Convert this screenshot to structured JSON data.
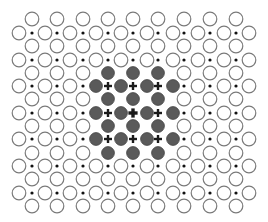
{
  "diagram": {
    "type": "crystal-lattice",
    "width": 268,
    "height": 222,
    "colors": {
      "background": "#ffffff",
      "open_circle_stroke": "#7a7a7a",
      "filled_circle": "#5a5a5a",
      "filled_circle_edge": "#444444",
      "dot": "#111111",
      "plus": "#1a1a1a"
    },
    "sizes": {
      "open_circle_radius": 6.8,
      "open_circle_stroke_width": 1.2,
      "filled_circle_radius": 6.4,
      "dot_radius": 1.6,
      "plus_arm": 4,
      "plus_stroke": 2.4,
      "plus_center_arm": 4.6,
      "plus_center_stroke": 3.4
    },
    "grid": {
      "offset_rows_y": [
        19,
        46,
        73,
        99,
        126,
        153,
        179,
        206
      ],
      "offset_rows_x": [
        32,
        57,
        83,
        108,
        133,
        158,
        184,
        210,
        236
      ],
      "main_rows_y": [
        33,
        60,
        86,
        113,
        139,
        166,
        193
      ],
      "main_rows_circle_x": [
        19,
        45,
        70,
        96,
        121,
        147,
        173,
        198,
        224,
        249
      ],
      "main_rows_dot_x": [
        32,
        57,
        83,
        108,
        133,
        158,
        184,
        210,
        236
      ]
    },
    "legend_of_symbols": [
      {
        "symbol": "open-circle",
        "meaning": "host lattice site"
      },
      {
        "symbol": "small-dot",
        "meaning": "interstitial site"
      },
      {
        "symbol": "filled-circle",
        "meaning": "substituted site in cluster"
      },
      {
        "symbol": "plus",
        "meaning": "interstitial within cluster"
      }
    ],
    "cluster": {
      "offset_rows_filled": {
        "rows_y": [
          73,
          99,
          126,
          153
        ],
        "x": [
          108,
          133,
          158
        ]
      },
      "main_rows_filled": {
        "rows_y": [
          86,
          113,
          139
        ],
        "circle_x": [
          96,
          121,
          147,
          173
        ],
        "plus_x": [
          108,
          133,
          158
        ]
      },
      "center_plus": {
        "x": 133,
        "y": 113,
        "bold": true
      }
    }
  }
}
